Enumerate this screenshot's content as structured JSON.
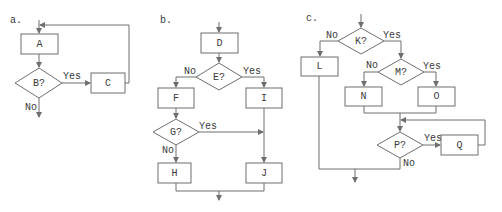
{
  "colors": {
    "stroke": "#6f6f6f",
    "text": "#3a3a3a",
    "background": "#ffffff"
  },
  "panels": {
    "a": {
      "label": "a.",
      "nodes": {
        "A": "A",
        "B": "B?",
        "C": "C"
      },
      "edge_labels": {
        "yes": "Yes",
        "no": "No"
      }
    },
    "b": {
      "label": "b.",
      "nodes": {
        "D": "D",
        "E": "E?",
        "F": "F",
        "G": "G?",
        "H": "H",
        "I": "I",
        "J": "J"
      },
      "edge_labels": {
        "e_no": "No",
        "e_yes": "Yes",
        "g_yes": "Yes",
        "g_no": "No"
      }
    },
    "c": {
      "label": "c.",
      "nodes": {
        "K": "K?",
        "L": "L",
        "M": "M?",
        "N": "N",
        "O": "O",
        "P": "P?",
        "Q": "Q"
      },
      "edge_labels": {
        "k_no": "No",
        "k_yes": "Yes",
        "m_no": "No",
        "m_yes": "Yes",
        "p_yes": "Yes",
        "p_no": "No"
      }
    }
  }
}
